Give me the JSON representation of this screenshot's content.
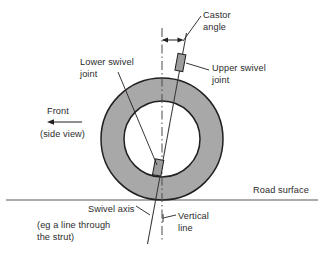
{
  "figure": {
    "type": "engineering-diagram",
    "background_color": "#ffffff",
    "line_color": "#231f20",
    "tire_fill_color": "#a8a8a8",
    "hub_fill_color": "#ffffff",
    "joint_fill_color": "#9d9d9d",
    "text_color": "#2b2b2b"
  },
  "labels": {
    "castor_angle": "Castor\nangle",
    "upper_swivel_joint": "Upper swivel\njoint",
    "lower_swivel_joint": "Lower swivel\njoint",
    "front": "Front",
    "side_view": "(side view)",
    "road_surface": "Road surface",
    "swivel_axis": "Swivel axis",
    "strut_note": "(eg a line through\nthe strut)",
    "vertical_line": "Vertical\nline"
  },
  "geometry": {
    "wheel_center": {
      "x": 162,
      "y": 139
    },
    "outer_radius": 61,
    "inner_radius": 38,
    "road_surface_y": 200,
    "vertical_line_x": 162,
    "vertical_line_top_y": 28,
    "vertical_line_bottom_y": 242,
    "swivel_axis_top": {
      "x": 186,
      "y": 34
    },
    "swivel_axis_bottom": {
      "x": 148,
      "y": 243
    },
    "upper_joint": {
      "x": 180,
      "y": 62,
      "width": 7,
      "height": 16
    },
    "lower_joint": {
      "x": 158,
      "y": 168,
      "width": 8,
      "height": 15
    },
    "castor_angle_arrow_y": 40,
    "front_arrow": {
      "x_start": 82,
      "x_end": 48,
      "y": 122
    }
  }
}
